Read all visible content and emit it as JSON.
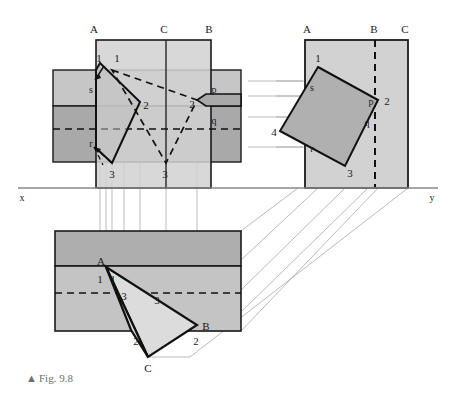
{
  "figure": {
    "caption_marker": "▲",
    "caption": "Fig. 9.8",
    "axis": {
      "left_label": "x",
      "right_label": "y",
      "y_position": 188
    },
    "colors": {
      "band_light": "#cfcfcf",
      "band_mid": "#c0c0c0",
      "band_dark": "#a8a8a8",
      "shape_fill_light": "#d9d9d9",
      "shape_fill_mid": "#b5b5b5",
      "shape_fill_pale": "#e3e3e3",
      "outline": "#111111",
      "projector": "#9a9a9a",
      "caption": "#6e6e6e"
    }
  },
  "views": {
    "front_elevation": {
      "name": "Front elevation (top-left)",
      "trace_labels": [
        "A",
        "C",
        "B"
      ],
      "vertex_labels": [
        "1",
        "1",
        "2",
        "2",
        "3",
        "3"
      ],
      "point_labels": [
        "s",
        "p",
        "q",
        "r"
      ]
    },
    "side_view": {
      "name": "Auxiliary / side view (top-right)",
      "trace_labels": [
        "A",
        "B",
        "C"
      ],
      "vertex_labels": [
        "1",
        "2",
        "3",
        "4"
      ],
      "point_labels": [
        "s",
        "p",
        "q",
        "r"
      ]
    },
    "plan": {
      "name": "Plan (bottom)",
      "corner_labels": [
        "A",
        "B",
        "C"
      ],
      "vertex_labels": [
        "1",
        "1",
        "3",
        "3",
        "2",
        "2"
      ]
    }
  },
  "labels": {
    "A": "A",
    "B": "B",
    "C": "C",
    "one": "1",
    "two": "2",
    "three": "3",
    "four": "4",
    "p": "p",
    "q": "q",
    "r": "r",
    "s": "s",
    "x": "x",
    "y": "y"
  }
}
